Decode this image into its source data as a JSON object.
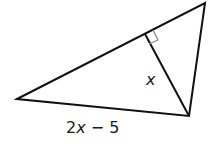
{
  "diagram": {
    "type": "right-triangle-altitude",
    "vertices": {
      "left": [
        17,
        99
      ],
      "top": [
        205,
        3
      ],
      "bottom": [
        189,
        116
      ]
    },
    "altitude_foot": [
      145,
      34
    ],
    "labels": {
      "altitude": "x",
      "base_expr_num": "2",
      "base_expr_var": "x",
      "base_expr_rest": " − 5"
    },
    "colors": {
      "line": "#111111",
      "right_angle_marker": "#888888"
    }
  }
}
